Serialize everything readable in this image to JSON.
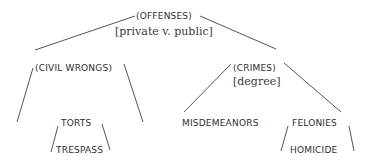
{
  "diagram": {
    "type": "tree",
    "line_color": "#555555",
    "nodes": {
      "root": {
        "label": "(OFFENSES)",
        "criterion": "[private v. public]"
      },
      "civil": {
        "label": "(CIVIL WRONGS)"
      },
      "crimes": {
        "label": "(CRIMES)",
        "criterion": "[degree]"
      },
      "torts": {
        "label": "TORTS"
      },
      "trespass": {
        "label": "TRESPASS"
      },
      "misdemeanors": {
        "label": "MISDEMEANORS"
      },
      "felonies": {
        "label": "FELONIES"
      },
      "homicide": {
        "label": "HOMICIDE"
      }
    },
    "edges": [
      {
        "from": "OFFENSES",
        "to": "CIVIL WRONGS"
      },
      {
        "from": "OFFENSES",
        "to": "CRIMES"
      },
      {
        "from": "CIVIL WRONGS",
        "to": "TORTS"
      },
      {
        "from": "TORTS",
        "to": "TRESPASS"
      },
      {
        "from": "CRIMES",
        "to": "MISDEMEANORS"
      },
      {
        "from": "CRIMES",
        "to": "FELONIES"
      },
      {
        "from": "FELONIES",
        "to": "HOMICIDE"
      }
    ]
  }
}
